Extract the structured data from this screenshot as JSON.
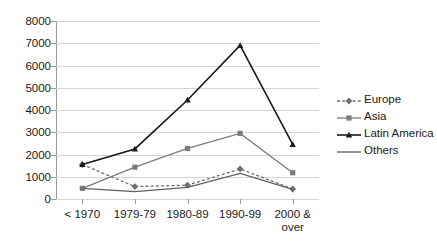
{
  "chart_data": {
    "type": "line",
    "title": "",
    "xlabel": "",
    "ylabel": "",
    "ylim": [
      0,
      8000
    ],
    "ytick_step": 1000,
    "grid": true,
    "legend_position": "right",
    "categories": [
      "< 1970",
      "1979-79",
      "1980-89",
      "1990-99",
      "2000 &\nover"
    ],
    "ytick_labels": [
      "0",
      "1000",
      "2000",
      "3000",
      "4000",
      "5000",
      "6000",
      "7000",
      "8000"
    ],
    "ytick_values": [
      0,
      1000,
      2000,
      3000,
      4000,
      5000,
      6000,
      7000,
      8000
    ],
    "series": [
      {
        "name": "Europe",
        "values": [
          1550,
          560,
          620,
          1350,
          450
        ],
        "color": "#6e6e6e",
        "line_style": "dashed",
        "marker": "diamond"
      },
      {
        "name": "Asia",
        "values": [
          480,
          1430,
          2270,
          2950,
          1180
        ],
        "color": "#7b7b7b",
        "line_style": "solid",
        "marker": "square"
      },
      {
        "name": "Latin America",
        "values": [
          1550,
          2250,
          4450,
          6900,
          2450
        ],
        "color": "#1a1a1a",
        "line_style": "solid",
        "marker": "triangle"
      },
      {
        "name": "Others",
        "values": [
          480,
          330,
          520,
          1150,
          430
        ],
        "color": "#5e5e5e",
        "line_style": "solid",
        "marker": "none"
      }
    ]
  },
  "legend": {
    "items": [
      {
        "label": "Europe"
      },
      {
        "label": "Asia"
      },
      {
        "label": "Latin America"
      },
      {
        "label": "Others"
      }
    ]
  }
}
